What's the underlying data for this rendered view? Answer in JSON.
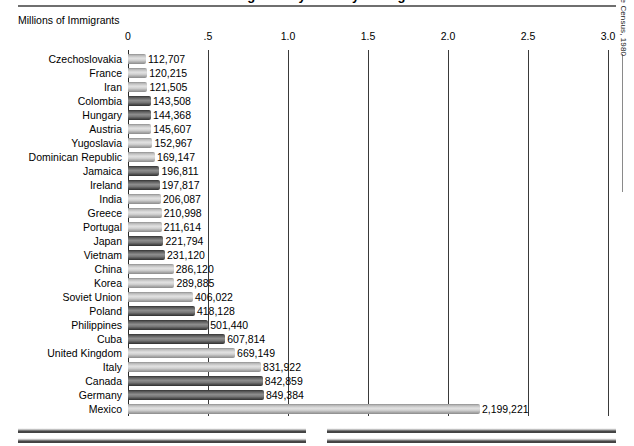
{
  "header": {
    "title": "Immigrants by Country of Origin",
    "top_rule": true
  },
  "source_note": "Source:  Bureau of the Census, 1980",
  "chart_data": {
    "type": "bar",
    "orientation": "horizontal",
    "title": "Immigrants by Country of Origin",
    "xlabel": "Millions of Immigrants",
    "ylabel": "",
    "xlim": [
      0,
      3.0
    ],
    "xticks": [
      0,
      0.5,
      1.0,
      1.5,
      2.0,
      2.5,
      3.0
    ],
    "xtick_labels": [
      "0",
      ".5",
      "1.0",
      "1.5",
      "2.0",
      "2.5",
      "3.0"
    ],
    "grid": true,
    "legend": null,
    "units": "people",
    "categories": [
      "Czechoslovakia",
      "France",
      "Iran",
      "Colombia",
      "Hungary",
      "Austria",
      "Yugoslavia",
      "Dominican Republic",
      "Jamaica",
      "Ireland",
      "India",
      "Greece",
      "Portugal",
      "Japan",
      "Vietnam",
      "China",
      "Korea",
      "Soviet Union",
      "Poland",
      "Philippines",
      "Cuba",
      "United Kingdom",
      "Italy",
      "Canada",
      "Germany",
      "Mexico"
    ],
    "values": [
      112707,
      120215,
      121505,
      143508,
      144368,
      145607,
      152967,
      169147,
      196811,
      197817,
      206087,
      210998,
      211614,
      221794,
      231120,
      286120,
      289885,
      406022,
      418128,
      501440,
      607814,
      669149,
      831922,
      842859,
      849384,
      2199221
    ],
    "value_labels": [
      "112,707",
      "120,215",
      "121,505",
      "143,508",
      "144,368",
      "145,607",
      "152,967",
      "169,147",
      "196,811",
      "197,817",
      "206,087",
      "210,998",
      "211,614",
      "221,794",
      "231,120",
      "286,120",
      "289,885",
      "406,022",
      "418,128",
      "501,440",
      "607,814",
      "669,149",
      "831,922",
      "842,859",
      "849,384",
      "2,199,221"
    ],
    "bar_shades": [
      "light",
      "light",
      "light",
      "dark",
      "dark",
      "light",
      "light",
      "light",
      "dark",
      "dark",
      "light",
      "light",
      "light",
      "dark",
      "dark",
      "light",
      "light",
      "light",
      "dark",
      "dark",
      "dark",
      "light",
      "light",
      "dark",
      "dark",
      "light"
    ]
  }
}
